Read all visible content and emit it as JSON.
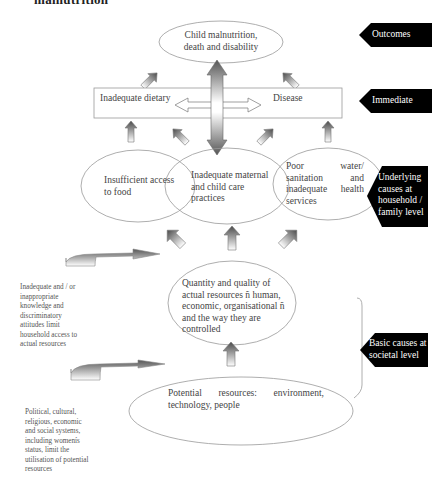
{
  "heading": "malnutrition",
  "nodes": {
    "outcome": "Child malnutrition, death and disability",
    "immediate_left": "Inadequate dietary",
    "immediate_right": "Disease",
    "underlying_food": "Insufficient access to food",
    "underlying_care": "Inadequate maternal and child care practices",
    "underlying_water": "Poor water/ sanitation and inadequate health services",
    "actual_resources": "Quantity and quality of actual resources ñ human, economic, organisational ñ and the way they are controlled",
    "potential_resources": "Potential resources: environment, technology, people"
  },
  "levels": {
    "outcomes": "Outcomes",
    "immediate": "Immediate",
    "underlying": "Underlying causes at household / family level",
    "basic": "Basic causes at societal level"
  },
  "notes": {
    "knowledge": "Inadequate and / or inappropriate knowledge and discriminatory attitudes limit household access to actual resources",
    "systems": "Political, cultural, religious, economic and social systems, including womenís status, limit the utilisation of potential resources"
  },
  "colors": {
    "tag_fill": "#000000",
    "line": "#888888",
    "arrow_dark": "#555555",
    "arrow_light": "#ffffff"
  }
}
